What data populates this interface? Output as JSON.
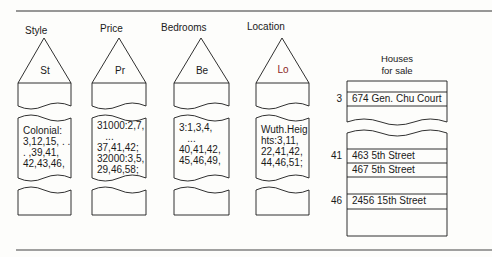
{
  "figure": {
    "columns": [
      {
        "key": "style",
        "label": "Style",
        "abbr": "St",
        "entries": "Colonial:\n3,12,15, . .\n. ,39,41,\n42,43,46,"
      },
      {
        "key": "price",
        "label": "Price",
        "abbr": "Pr",
        "entries": "31000:2,7,\n   ...\n37,41,42;\n32000:3,5,\n29,46,58;"
      },
      {
        "key": "bedrooms",
        "label": "Bedrooms",
        "abbr": "Be",
        "entries": "3:1,3,4,\n   ...\n40,41,42,\n45,46,49,"
      },
      {
        "key": "location",
        "label": "Location",
        "abbr": "Lo",
        "entries": "Wuth.Heig\nhts:3,11,\n22,41,42,\n44,46,51;"
      }
    ],
    "houses": {
      "title_line1": "Houses",
      "title_line2": "for sale",
      "rows": [
        {
          "num": "3",
          "address": "674 Gen. Chu Court"
        },
        {
          "num": "41",
          "address": "463 5th Street"
        },
        {
          "num": "",
          "address": "467 5th Street"
        },
        {
          "num": "46",
          "address": "2456 15th Street"
        }
      ]
    },
    "colors": {
      "ink": "#1a1a1a",
      "location_abbr": "#8a1f1f",
      "rule": "#333333"
    }
  }
}
